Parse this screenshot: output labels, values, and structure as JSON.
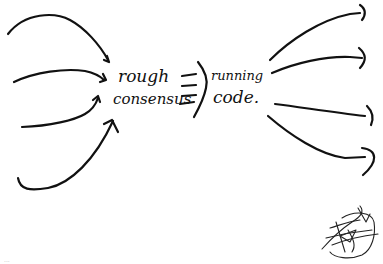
{
  "diagram": {
    "left_label": {
      "line1": "rough",
      "line2": "consensus"
    },
    "implies_symbol": "⇒",
    "right_label": {
      "line1": "running",
      "line2": "code."
    },
    "incoming_arrow_count": 4,
    "outgoing_arrow_count": 4,
    "signature": "signature-scribble",
    "corner_mark": "..."
  },
  "colors": {
    "ink": "#111111",
    "background": "#ffffff"
  }
}
